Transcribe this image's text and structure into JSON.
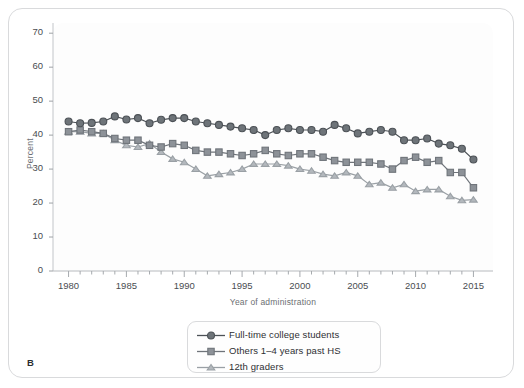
{
  "figure": {
    "panel_letter": "B"
  },
  "chart_data": {
    "type": "line",
    "title": "",
    "xlabel": "Year of administration",
    "ylabel": "Percent",
    "xlim": [
      1979,
      2016
    ],
    "ylim": [
      0,
      73
    ],
    "yticks": [
      0,
      10,
      20,
      30,
      40,
      50,
      60,
      70
    ],
    "xticks": [
      1980,
      1985,
      1990,
      1995,
      2000,
      2005,
      2010,
      2015
    ],
    "xtick_minor_step": 1,
    "grid": false,
    "legend_position": "below-center",
    "x": [
      1980,
      1981,
      1982,
      1983,
      1984,
      1985,
      1986,
      1987,
      1988,
      1989,
      1990,
      1991,
      1992,
      1993,
      1994,
      1995,
      1996,
      1997,
      1998,
      1999,
      2000,
      2001,
      2002,
      2003,
      2004,
      2005,
      2006,
      2007,
      2008,
      2009,
      2010,
      2011,
      2012,
      2013,
      2014,
      2015
    ],
    "series": [
      {
        "name": "Full-time college students",
        "marker": "circle",
        "color": "#6e7479",
        "values": [
          44.0,
          43.5,
          43.6,
          44.0,
          45.5,
          44.6,
          45.0,
          43.5,
          44.5,
          45.0,
          45.0,
          44.0,
          43.5,
          43.0,
          42.5,
          42.0,
          41.5,
          40.0,
          41.5,
          42.0,
          41.5,
          41.5,
          41.0,
          43.0,
          42.0,
          40.5,
          41.0,
          41.5,
          41.0,
          38.5,
          38.5,
          39.0,
          37.5,
          37.0,
          36.0,
          32.8
        ]
      },
      {
        "name": "Others 1–4 years past HS",
        "marker": "square",
        "color": "#8d9298",
        "values": [
          41.0,
          41.5,
          41.0,
          40.5,
          39.0,
          38.5,
          38.5,
          37.0,
          36.5,
          37.5,
          37.0,
          35.5,
          35.0,
          35.0,
          34.5,
          34.0,
          34.5,
          35.5,
          34.5,
          34.0,
          34.5,
          34.5,
          33.5,
          32.5,
          32.0,
          32.0,
          32.0,
          31.5,
          30.0,
          32.5,
          33.5,
          32.0,
          32.5,
          29.0,
          29.0,
          24.5
        ]
      },
      {
        "name": "12th graders",
        "marker": "triangle",
        "color": "#b3b8bd",
        "values": [
          41.0,
          41.0,
          40.5,
          40.5,
          38.5,
          37.0,
          36.5,
          37.5,
          35.0,
          33.0,
          32.0,
          30.0,
          28.0,
          28.5,
          29.0,
          30.0,
          31.5,
          31.5,
          31.5,
          31.0,
          30.0,
          29.5,
          28.5,
          28.0,
          29.0,
          28.0,
          25.5,
          26.0,
          24.5,
          25.5,
          23.5,
          24.0,
          24.0,
          22.0,
          20.8,
          21.0
        ]
      }
    ]
  },
  "legend": {
    "items": [
      {
        "label": "Full-time college students",
        "marker": "circle"
      },
      {
        "label": "Others 1–4 years past HS",
        "marker": "square"
      },
      {
        "label": "12th graders",
        "marker": "triangle"
      }
    ]
  }
}
